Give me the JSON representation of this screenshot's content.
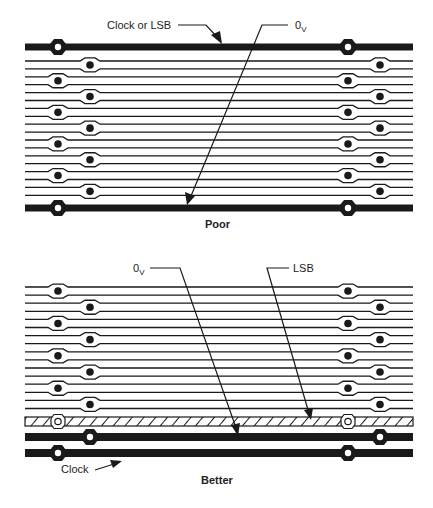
{
  "diagrams": [
    {
      "caption": "Poor",
      "labels": {
        "clock_or_lsb": "Clock or LSB",
        "zero_v_main": "0",
        "zero_v_sub": "V"
      },
      "description": "Clock or LSB trace on top edge, 0V trace on bottom edge, 18 signal traces in between"
    },
    {
      "caption": "Better",
      "labels": {
        "zero_v_main": "0",
        "zero_v_sub": "V",
        "lsb": "LSB",
        "clock": "Clock"
      },
      "description": "16 signal traces, hatched LSB trace, 0V trace, then Clock trace at bottom"
    }
  ],
  "colors": {
    "trace": "#1a1a1a",
    "background": "#ffffff"
  }
}
